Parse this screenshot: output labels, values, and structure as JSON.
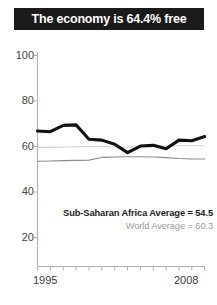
{
  "title": {
    "text": "The economy is 64.4% free"
  },
  "colors": {
    "title_bar_bg": "#1a1a1a",
    "title_text": "#ffffff",
    "score_line": "#111111",
    "world_average_line": "#cfcfcf",
    "region_average_line": "#8c8c8c",
    "axis": "#b0b0b0",
    "tick_label": "#444444",
    "region_label_text": "#1c1c1c",
    "world_label_text": "#9a9a9a"
  },
  "annotations": {
    "region_average": "Sub-Saharan Africa Average = 54.5",
    "world_average": "World Average = 60.3"
  },
  "chart_data": {
    "type": "line",
    "title": "The economy is 64.4% free",
    "xlabel": "",
    "ylabel": "",
    "xlim": [
      1995,
      2008
    ],
    "ylim": [
      0,
      100
    ],
    "yticks": [
      100,
      80,
      60,
      40,
      20
    ],
    "xticks": [
      1995,
      1996,
      1997,
      1998,
      1999,
      2000,
      2001,
      2002,
      2003,
      2004,
      2005,
      2006,
      2007,
      2008
    ],
    "xtick_labels_shown": [
      "1995",
      "2008"
    ],
    "grid": false,
    "legend": "none",
    "x": [
      1995,
      1996,
      1997,
      1998,
      1999,
      2000,
      2001,
      2002,
      2003,
      2004,
      2005,
      2006,
      2007,
      2008
    ],
    "series": [
      {
        "name": "Economic freedom score",
        "style": "thick-black",
        "values": [
          66.8,
          66.5,
          69.3,
          69.5,
          63.2,
          62.8,
          61.0,
          57.3,
          60.2,
          60.5,
          59.0,
          62.8,
          62.5,
          64.4
        ]
      },
      {
        "name": "World Average",
        "style": "thin-light-gray",
        "value": 60.3,
        "values": [
          59.6,
          59.6,
          59.8,
          59.9,
          60.0,
          60.0,
          59.8,
          59.7,
          59.9,
          60.1,
          60.2,
          60.3,
          60.3,
          60.3
        ]
      },
      {
        "name": "Sub-Saharan Africa Average",
        "style": "thin-mid-gray",
        "value": 54.5,
        "values": [
          53.5,
          53.6,
          53.8,
          53.9,
          54.0,
          55.2,
          55.4,
          55.5,
          55.5,
          55.4,
          55.1,
          54.7,
          54.5,
          54.5
        ]
      }
    ]
  },
  "axis_labels": {
    "y": [
      "100",
      "80",
      "60",
      "40",
      "20"
    ],
    "x_start": "1995",
    "x_end": "2008"
  }
}
